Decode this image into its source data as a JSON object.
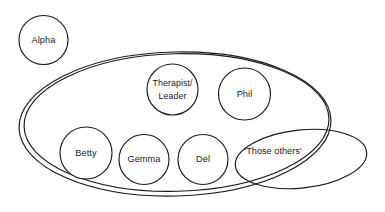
{
  "diagram": {
    "background_color": "#ffffff",
    "stroke_color": "#1a1a1a",
    "fill_color": "#ffffff",
    "outside_nodes": [
      {
        "id": "alpha",
        "label": "Alpha",
        "shape": "circle",
        "cx": 43.5,
        "cy": 40,
        "r": 24.5
      }
    ],
    "group_boundary": {
      "id": "main-group",
      "shape": "ellipse-double",
      "cx": 175,
      "cy": 124,
      "rx": 156,
      "ry": 72,
      "rotation": -1.5,
      "inner_offset": 3.2,
      "label": ""
    },
    "subgroup_boundary": {
      "id": "those-others-group",
      "label": "‘Those others’",
      "shape": "ellipse",
      "cx": 301,
      "cy": 159,
      "rx": 66,
      "ry": 29,
      "rotation": -6,
      "label_x": 273,
      "label_y": 152
    },
    "member_nodes": [
      {
        "id": "therapist-leader",
        "label_line1": "Therapist/",
        "label_line2": "Leader",
        "shape": "circle",
        "cx": 172.5,
        "cy": 89.5,
        "r": 25.5
      },
      {
        "id": "phil",
        "label": "Phil",
        "shape": "circle",
        "cx": 244.5,
        "cy": 94,
        "r": 26
      },
      {
        "id": "betty",
        "label": "Betty",
        "shape": "circle",
        "cx": 86,
        "cy": 153,
        "r": 26
      },
      {
        "id": "gemma",
        "label": "Gemma",
        "shape": "circle",
        "cx": 144,
        "cy": 159.5,
        "r": 25
      },
      {
        "id": "del",
        "label": "Del",
        "shape": "circle",
        "cx": 203,
        "cy": 159.5,
        "r": 25
      }
    ]
  }
}
